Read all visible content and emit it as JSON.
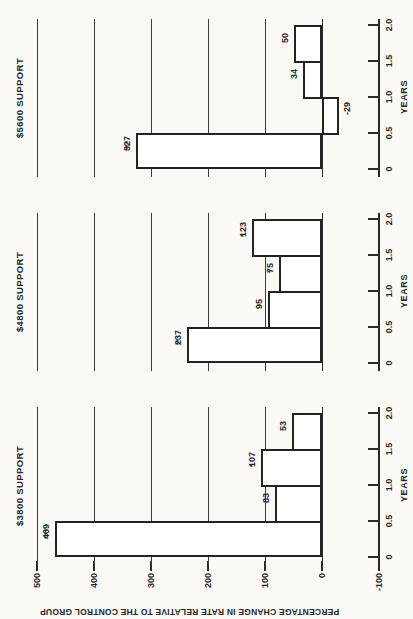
{
  "figure": {
    "kind": "scanned statistical figure, whole chart rotated 90 degrees counter-clockwise on the page"
  },
  "chart_data": {
    "type": "bar",
    "ylabel": "PERCENTAGE CHANGE IN RATE RELATIVE TO THE CONTROL GROUP",
    "xlabel": "YEARS",
    "x_tick_labels": [
      "0",
      "0.5",
      "1.0",
      "1.5",
      "2.0"
    ],
    "y_ticks": [
      500,
      400,
      300,
      200,
      100,
      0,
      -100
    ],
    "ylim": [
      -100,
      500
    ],
    "bar_width_years": 0.5,
    "grid": "horizontal gridlines at every 100 units",
    "legend": "none",
    "panels": [
      {
        "title": "$3800 SUPPORT",
        "categories": [
          "0-0.5",
          "0.5-1.0",
          "1.0-1.5",
          "1.5-2.0"
        ],
        "values": [
          469,
          83,
          107,
          53
        ],
        "value_text": [
          "469",
          "83",
          "107",
          "53"
        ],
        "stars": [
          "***",
          "",
          "*",
          ""
        ],
        "labels": [
          "469***",
          "83",
          "107*",
          "53"
        ]
      },
      {
        "title": "$4800 SUPPORT",
        "categories": [
          "0-0.5",
          "0.5-1.0",
          "1.0-1.5",
          "1.5-2.0"
        ],
        "values": [
          237,
          95,
          75,
          123
        ],
        "value_text": [
          "237",
          "95",
          "75",
          "123"
        ],
        "stars": [
          "**",
          "",
          "*",
          "*"
        ],
        "labels": [
          "237**",
          "95",
          "75*",
          "123*"
        ]
      },
      {
        "title": "$5600 SUPPORT",
        "categories": [
          "0-0.5",
          "0.5-1.0",
          "1.0-1.5",
          "1.5-2.0"
        ],
        "values": [
          327,
          -29,
          34,
          50
        ],
        "value_text": [
          "327",
          "-29",
          "34",
          "50"
        ],
        "stars": [
          "***",
          "",
          "",
          ""
        ],
        "labels": [
          "327***",
          "-29",
          "34",
          "50"
        ]
      }
    ],
    "colors": {
      "ink": "#2a2a2a",
      "paper": "#faf9f6",
      "bar_fill": "#ffffff"
    }
  }
}
